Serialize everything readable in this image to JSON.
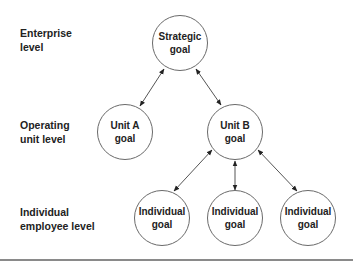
{
  "levels": [
    {
      "line1": "Enterprise",
      "line2": "level"
    },
    {
      "line1": "Operating",
      "line2": "unit level"
    },
    {
      "line1": "Individual",
      "line2": "employee level"
    }
  ],
  "nodes": {
    "strategic": {
      "line1": "Strategic",
      "line2": "goal"
    },
    "unit_a": {
      "line1": "Unit A",
      "line2": "goal"
    },
    "unit_b": {
      "line1": "Unit B",
      "line2": "goal"
    },
    "individual_1": {
      "line1": "Individual",
      "line2": "goal"
    },
    "individual_2": {
      "line1": "Individual",
      "line2": "goal"
    },
    "individual_3": {
      "line1": "Individual",
      "line2": "goal"
    }
  },
  "colors": {
    "stroke": "#6a6a6a",
    "text": "#222222",
    "rule": "#8a8a8a"
  }
}
